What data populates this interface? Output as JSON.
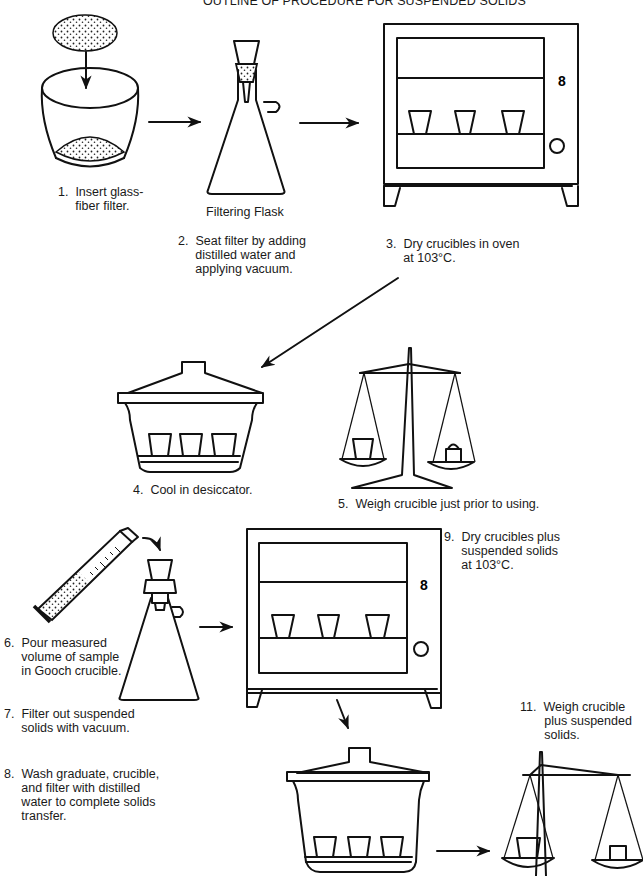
{
  "title": "OUTLINE OF PROCEDURE FOR SUSPENDED SOLIDS",
  "figures": {
    "filtering_flask_caption": "Filtering Flask"
  },
  "steps": [
    {
      "number": "1.",
      "text": "Insert glass-\nfiber filter."
    },
    {
      "number": "2.",
      "text": "Seat filter by adding\ndistilled water and\napplying vacuum."
    },
    {
      "number": "3.",
      "text": "Dry crucibles in oven\nat 103°C."
    },
    {
      "number": "4.",
      "text": "Cool in desiccator."
    },
    {
      "number": "5.",
      "text": "Weigh crucible just prior to using."
    },
    {
      "number": "6.",
      "text": "Pour measured\nvolume of sample\nin Gooch crucible."
    },
    {
      "number": "7.",
      "text": "Filter out suspended\nsolids with vacuum."
    },
    {
      "number": "8.",
      "text": "Wash graduate, crucible,\nand filter with distilled\nwater to complete solids\ntransfer."
    },
    {
      "number": "9.",
      "text": "Dry crucibles plus\nsuspended solids\nat 103°C."
    },
    {
      "number": "11.",
      "text": "Weigh crucible\nplus suspended\nsolids."
    }
  ],
  "icons": [
    "crucible-with-filter",
    "filtering-flask",
    "drying-oven",
    "desiccator",
    "balance-scale",
    "graduated-cylinder",
    "flow-arrow"
  ]
}
